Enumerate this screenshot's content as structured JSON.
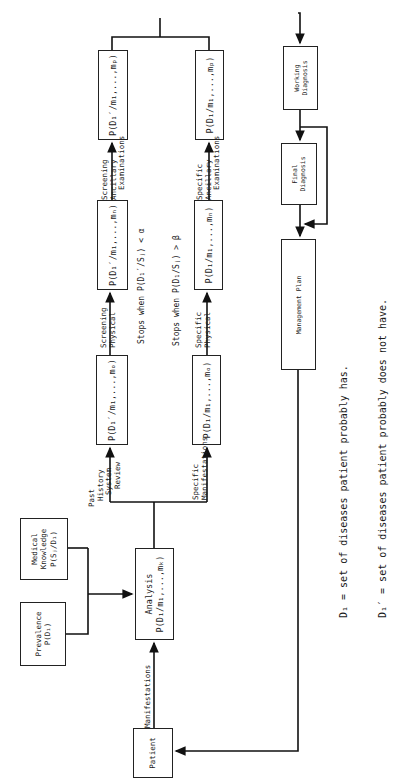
{
  "diagram": {
    "nodes": {
      "patient": "Patient",
      "prevalence": {
        "title": "Prevalence",
        "formula": "P(D₁)"
      },
      "medical_knowledge": {
        "line1": "Medical",
        "line2": "Knowledge",
        "formula": "P(Sⱼ/D₁)"
      },
      "analysis": {
        "title": "Analysis",
        "formula": "P(D₁/m₁,...,mₖ)"
      },
      "screen_history": "P(D₁′/m₁,...,mₒ)",
      "screen_physical": "P(D₁′/m₁,...,mₙ)",
      "screen_ancillary": "P(D₁′/m₁,...,mₚ)",
      "specific_manifest": "P(D₁/m₁,...,mₒ)",
      "specific_physical": "P(D₁/m₁,...,mₙ)",
      "specific_ancillary": "P(D₁/m₁,...,mₚ)",
      "working_diagnosis": {
        "line1": "Working",
        "line2": "Diagnosis"
      },
      "final_diagnosis": {
        "line1": "Final",
        "line2": "Diagnosis"
      },
      "management_plan": "Management Plan"
    },
    "edge_labels": {
      "manifestations": "Manifestations",
      "past_history": {
        "line1": "Past",
        "line2": "History",
        "line3": "System",
        "line4": "Review"
      },
      "specific_manifestations": {
        "line1": "Specific",
        "line2": "Manifestations"
      },
      "screening_physical": {
        "line1": "Screening",
        "line2": "Physical"
      },
      "specific_physical": {
        "line1": "Specific",
        "line2": "Physical"
      },
      "screening_ancillary": {
        "line1": "Screening",
        "line2": "Ancillary",
        "line3": "Examinations"
      },
      "specific_ancillary": {
        "line1": "Specific",
        "line2": "Ancillary",
        "line3": "Examinations"
      }
    },
    "stop_conditions": {
      "screening": "Stops when P(D₁′/Sⱼ) < α",
      "specific": "Stops when P(D₁/Sⱼ) > β"
    },
    "legend": {
      "d1": "D₁ = set of diseases patient probably has.",
      "d1_prime": "D₁′ = set of diseases patient probably does not have."
    }
  }
}
